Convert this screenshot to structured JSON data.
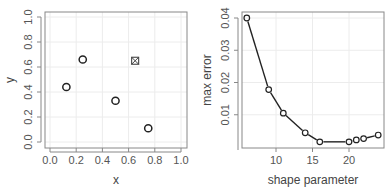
{
  "chart_data": [
    {
      "type": "scatter",
      "title": "",
      "xlabel": "x",
      "ylabel": "y",
      "xlim": [
        0,
        1
      ],
      "ylim": [
        0,
        1
      ],
      "grid": true,
      "x_ticks": [
        "0.0",
        "0.2",
        "0.4",
        "0.6",
        "0.8",
        "1.0"
      ],
      "y_ticks": [
        "0.0",
        "0.2",
        "0.4",
        "0.6",
        "0.8",
        "1.0"
      ],
      "series": [
        {
          "name": "points",
          "marker": "open-circle",
          "x": [
            0.125,
            0.25,
            0.5,
            0.75
          ],
          "y": [
            0.44,
            0.66,
            0.33,
            0.11
          ]
        },
        {
          "name": "highlighted-point",
          "marker": "square-cross",
          "x": [
            0.65
          ],
          "y": [
            0.65
          ]
        }
      ]
    },
    {
      "type": "line",
      "title": "",
      "xlabel": "shape parameter",
      "ylabel": "max error",
      "xlim": [
        6,
        24
      ],
      "ylim": [
        0.0,
        0.04
      ],
      "grid": true,
      "x_ticks": [
        "10",
        "15",
        "20"
      ],
      "y_ticks": [
        "0.01",
        "0.02",
        "0.03",
        "0.04"
      ],
      "series": [
        {
          "name": "max error",
          "marker": "open-circle",
          "x": [
            6,
            9,
            11,
            14,
            16,
            20,
            21,
            22,
            24
          ],
          "y": [
            0.04,
            0.0178,
            0.0105,
            0.0044,
            0.0016,
            0.0016,
            0.0022,
            0.0026,
            0.0037
          ]
        }
      ]
    }
  ]
}
